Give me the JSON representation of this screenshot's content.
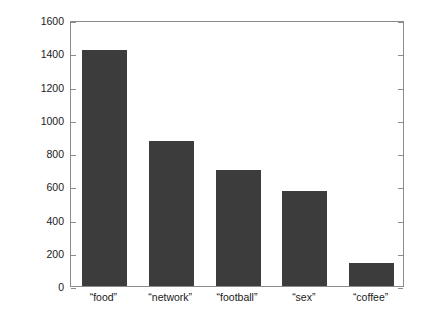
{
  "chart_data": {
    "type": "bar",
    "title": "",
    "subtitle": "",
    "xlabel": "",
    "ylabel": "Millions of entries",
    "categories": [
      "“food”",
      "“network”",
      "“football”",
      "“sex”",
      "“coffee”"
    ],
    "values": [
      1420,
      870,
      700,
      570,
      140
    ],
    "ylim": [
      0,
      1600
    ],
    "yticks": [
      0,
      200,
      400,
      600,
      800,
      1000,
      1200,
      1400,
      1600
    ],
    "ytick_labels": [
      "0",
      "200",
      "400",
      "600",
      "800",
      "1000",
      "1200",
      "1400",
      "1600"
    ],
    "grid": false,
    "legend": false,
    "legend_position": "none",
    "bar_color": "#3c3c3c",
    "axis_color": "#8c8c8c",
    "background_color": "#ffffff",
    "text_color": "#1a1a1a"
  },
  "figure": {
    "axis_box_name": "plot-area"
  }
}
